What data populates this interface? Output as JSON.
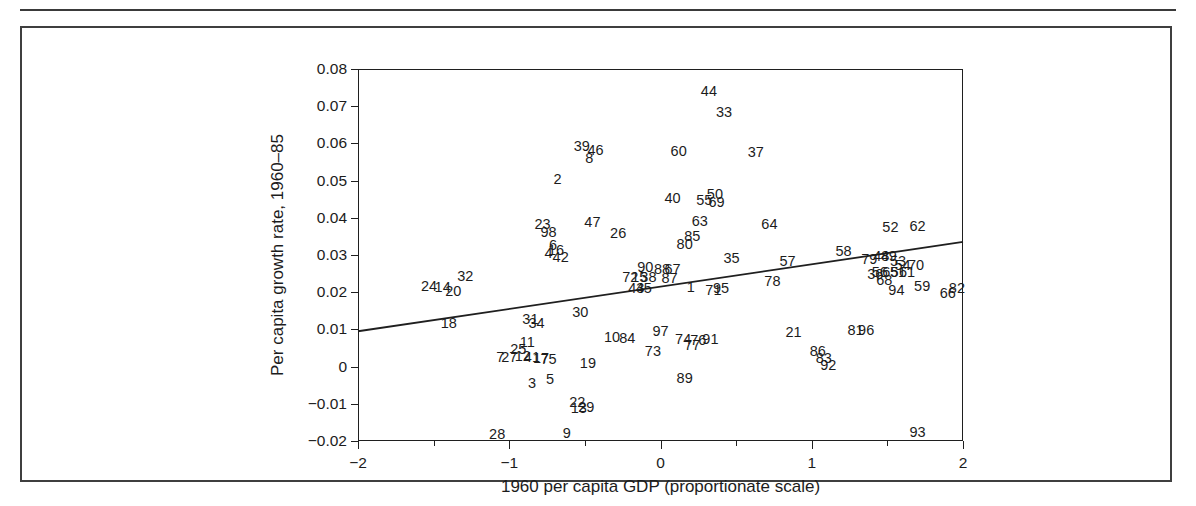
{
  "figure": {
    "kind": "scatter-plot-with-regression-line"
  },
  "chart_data": {
    "type": "scatter",
    "title": "",
    "xlabel": "1960 per capita GDP (proportionate scale)",
    "ylabel": "Per capita growth rate, 1960–85",
    "xlim": [
      -2,
      2
    ],
    "ylim": [
      -0.02,
      0.08
    ],
    "grid": false,
    "legend": null,
    "xticks": [
      -2,
      -1,
      0,
      1,
      2
    ],
    "xtick_labels": [
      "−2",
      "−1",
      "0",
      "1",
      "2"
    ],
    "xminor_ticks": [
      -1.5,
      -0.5,
      0.5,
      1.5
    ],
    "yticks": [
      -0.02,
      -0.01,
      0,
      0.01,
      0.02,
      0.03,
      0.04,
      0.05,
      0.06,
      0.07,
      0.08
    ],
    "ytick_labels": [
      "−0.02",
      "−0.01",
      "0",
      "0.01",
      "0.02",
      "0.03",
      "0.04",
      "0.05",
      "0.06",
      "0.07",
      "0.08"
    ],
    "point_marker": "numeric-label",
    "fit_line": {
      "x": [
        -2,
        2
      ],
      "y": [
        0.0095,
        0.0335
      ],
      "slope": 0.006,
      "intercept": 0.0215
    },
    "points": [
      {
        "label": "1",
        "x": 0.2,
        "y": 0.0213
      },
      {
        "label": "2",
        "x": -0.68,
        "y": 0.0503
      },
      {
        "label": "3",
        "x": -0.85,
        "y": -0.0043
      },
      {
        "label": "4",
        "x": -0.74,
        "y": 0.0305
      },
      {
        "label": "5",
        "x": -0.73,
        "y": -0.0032
      },
      {
        "label": "6",
        "x": -0.71,
        "y": 0.0327
      },
      {
        "label": "7",
        "x": -1.06,
        "y": 0.0026
      },
      {
        "label": "8",
        "x": -0.47,
        "y": 0.0562
      },
      {
        "label": "9",
        "x": -0.62,
        "y": -0.0179
      },
      {
        "label": "10",
        "x": -0.32,
        "y": 0.008
      },
      {
        "label": "11",
        "x": -0.88,
        "y": 0.0066
      },
      {
        "label": "12",
        "x": -0.91,
        "y": 0.0029
      },
      {
        "label": "13",
        "x": -0.54,
        "y": -0.011
      },
      {
        "label": "14",
        "x": -1.44,
        "y": 0.0215
      },
      {
        "label": "15",
        "x": -0.14,
        "y": 0.0241
      },
      {
        "label": "16",
        "x": -0.69,
        "y": 0.0313
      },
      {
        "label": "17",
        "x": -0.79,
        "y": 0.0023
      },
      {
        "label": "18",
        "x": -1.4,
        "y": 0.0118
      },
      {
        "label": "19",
        "x": -0.48,
        "y": 0.001
      },
      {
        "label": "20",
        "x": -1.37,
        "y": 0.0202
      },
      {
        "label": "21",
        "x": 0.88,
        "y": 0.0093
      },
      {
        "label": "22",
        "x": -0.55,
        "y": -0.0096
      },
      {
        "label": "23",
        "x": -0.78,
        "y": 0.0383
      },
      {
        "label": "24",
        "x": -1.53,
        "y": 0.0218
      },
      {
        "label": "25",
        "x": -0.94,
        "y": 0.0046
      },
      {
        "label": "26",
        "x": -0.28,
        "y": 0.0359
      },
      {
        "label": "27",
        "x": -1.0,
        "y": 0.0026
      },
      {
        "label": "28",
        "x": -1.08,
        "y": -0.0182
      },
      {
        "label": "29",
        "x": -0.49,
        "y": -0.0108
      },
      {
        "label": "30",
        "x": -0.53,
        "y": 0.0147
      },
      {
        "label": "31",
        "x": -0.86,
        "y": 0.0128
      },
      {
        "label": "32",
        "x": -1.29,
        "y": 0.0243
      },
      {
        "label": "33",
        "x": 0.42,
        "y": 0.0685
      },
      {
        "label": "34",
        "x": -0.82,
        "y": 0.0117
      },
      {
        "label": "35",
        "x": 0.47,
        "y": 0.0291
      },
      {
        "label": "36",
        "x": 1.42,
        "y": 0.0249
      },
      {
        "label": "37",
        "x": 0.63,
        "y": 0.0578
      },
      {
        "label": "38",
        "x": -0.08,
        "y": 0.024
      },
      {
        "label": "39",
        "x": -0.52,
        "y": 0.0593
      },
      {
        "label": "40",
        "x": 0.08,
        "y": 0.0452
      },
      {
        "label": "41",
        "x": -0.85,
        "y": 0.0025
      },
      {
        "label": "42",
        "x": -0.66,
        "y": 0.0295
      },
      {
        "label": "43",
        "x": -0.16,
        "y": 0.0212
      },
      {
        "label": "44",
        "x": 0.32,
        "y": 0.074
      },
      {
        "label": "45",
        "x": -0.11,
        "y": 0.0212
      },
      {
        "label": "46",
        "x": -0.43,
        "y": 0.0583
      },
      {
        "label": "47",
        "x": -0.45,
        "y": 0.0388
      },
      {
        "label": "48",
        "x": 1.46,
        "y": 0.0296
      },
      {
        "label": "49",
        "x": 1.51,
        "y": 0.0296
      },
      {
        "label": "50",
        "x": 0.36,
        "y": 0.0463
      },
      {
        "label": "51",
        "x": 1.57,
        "y": 0.0254
      },
      {
        "label": "52",
        "x": 1.52,
        "y": 0.0375
      },
      {
        "label": "53",
        "x": 1.57,
        "y": 0.0285
      },
      {
        "label": "54",
        "x": 1.6,
        "y": 0.0272
      },
      {
        "label": "55",
        "x": 0.29,
        "y": 0.0447
      },
      {
        "label": "56",
        "x": 1.45,
        "y": 0.0254
      },
      {
        "label": "57",
        "x": 0.84,
        "y": 0.0283
      },
      {
        "label": "58",
        "x": 1.21,
        "y": 0.0311
      },
      {
        "label": "59",
        "x": 1.73,
        "y": 0.0216
      },
      {
        "label": "60",
        "x": 0.12,
        "y": 0.058
      },
      {
        "label": "61",
        "x": 1.63,
        "y": 0.0253
      },
      {
        "label": "62",
        "x": 1.7,
        "y": 0.0379
      },
      {
        "label": "63",
        "x": 0.26,
        "y": 0.0392
      },
      {
        "label": "64",
        "x": 0.72,
        "y": 0.0382
      },
      {
        "label": "65",
        "x": 1.52,
        "y": 0.0254
      },
      {
        "label": "66",
        "x": 1.9,
        "y": 0.0197
      },
      {
        "label": "67",
        "x": 0.08,
        "y": 0.0263
      },
      {
        "label": "68",
        "x": 1.48,
        "y": 0.0232
      },
      {
        "label": "69",
        "x": 0.37,
        "y": 0.0443
      },
      {
        "label": "70",
        "x": 1.69,
        "y": 0.0274
      },
      {
        "label": "71",
        "x": 0.35,
        "y": 0.0205
      },
      {
        "label": "72",
        "x": -0.2,
        "y": 0.0241
      },
      {
        "label": "73",
        "x": -0.05,
        "y": 0.0041
      },
      {
        "label": "74",
        "x": 0.15,
        "y": 0.0073
      },
      {
        "label": "75",
        "x": -0.74,
        "y": 0.0021
      },
      {
        "label": "76",
        "x": 0.25,
        "y": 0.0072
      },
      {
        "label": "77",
        "x": 0.21,
        "y": 0.0058
      },
      {
        "label": "78",
        "x": 0.74,
        "y": 0.023
      },
      {
        "label": "79",
        "x": 1.38,
        "y": 0.0288
      },
      {
        "label": "80",
        "x": 0.16,
        "y": 0.0329
      },
      {
        "label": "81",
        "x": 1.29,
        "y": 0.0099
      },
      {
        "label": "82",
        "x": 1.96,
        "y": 0.0211
      },
      {
        "label": "83",
        "x": 1.08,
        "y": 0.0022
      },
      {
        "label": "84",
        "x": -0.22,
        "y": 0.0078
      },
      {
        "label": "85",
        "x": 0.21,
        "y": 0.0352
      },
      {
        "label": "86",
        "x": 1.04,
        "y": 0.0043
      },
      {
        "label": "87",
        "x": 0.06,
        "y": 0.0238
      },
      {
        "label": "88",
        "x": 0.01,
        "y": 0.0262
      },
      {
        "label": "89",
        "x": 0.16,
        "y": -0.003
      },
      {
        "label": "90",
        "x": -0.1,
        "y": 0.0268
      },
      {
        "label": "91",
        "x": 0.33,
        "y": 0.0073
      },
      {
        "label": "92",
        "x": 1.11,
        "y": 0.0005
      },
      {
        "label": "93",
        "x": 1.7,
        "y": -0.0175
      },
      {
        "label": "94",
        "x": 1.56,
        "y": 0.0207
      },
      {
        "label": "95",
        "x": 0.4,
        "y": 0.021
      },
      {
        "label": "96",
        "x": 1.36,
        "y": 0.0099
      },
      {
        "label": "97",
        "x": 0.0,
        "y": 0.0096
      },
      {
        "label": "98",
        "x": -0.74,
        "y": 0.0362
      }
    ]
  }
}
